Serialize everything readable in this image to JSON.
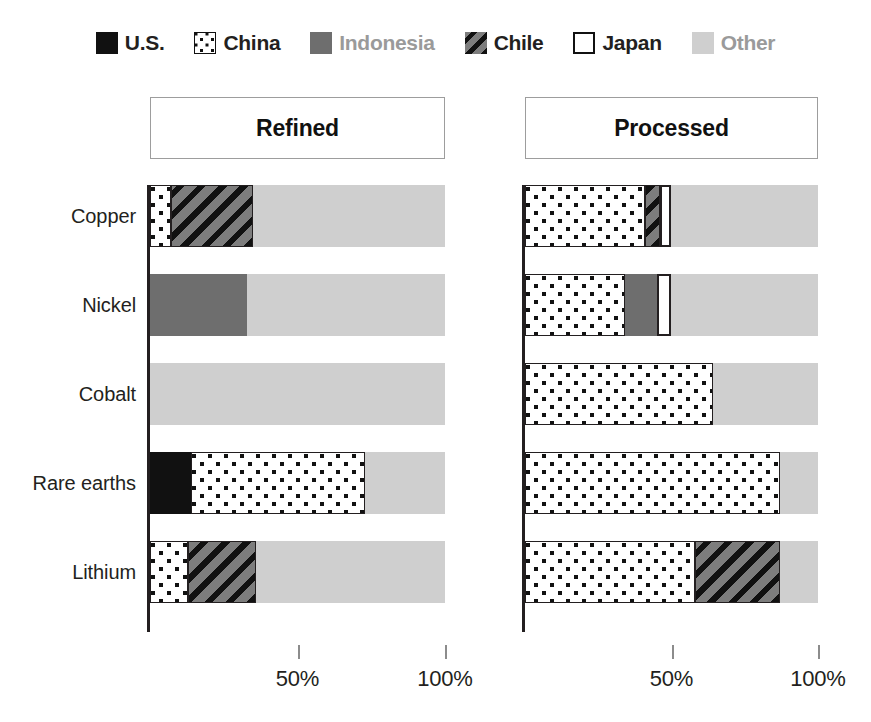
{
  "legend": {
    "items": [
      {
        "label": "U.S.",
        "key": "us",
        "swatch": "solid-black-swatch-icon",
        "muted": false
      },
      {
        "label": "China",
        "key": "china",
        "swatch": "dotted-box-swatch-icon",
        "muted": false
      },
      {
        "label": "Indonesia",
        "key": "indonesia",
        "swatch": "solid-gray-swatch-icon",
        "muted": true
      },
      {
        "label": "Chile",
        "key": "chile",
        "swatch": "hatched-box-swatch-icon",
        "muted": false
      },
      {
        "label": "Japan",
        "key": "japan",
        "swatch": "outlined-white-swatch-icon",
        "muted": false
      },
      {
        "label": "Other",
        "key": "other",
        "swatch": "light-gray-swatch-icon",
        "muted": true
      }
    ]
  },
  "panels": {
    "refined": {
      "title": "Refined"
    },
    "processed": {
      "title": "Processed"
    }
  },
  "axis": {
    "ticks": [
      {
        "value": 50,
        "label": "50%"
      },
      {
        "value": 100,
        "label": "100%"
      }
    ],
    "min": 0,
    "max": 100
  },
  "colors": {
    "us": "#111111",
    "china": "#ffffff",
    "indonesia": "#6e6e6e",
    "chile": "#7d7d7d",
    "japan": "#ffffff",
    "other": "#cfcfcf",
    "axis": "#231f20",
    "muted_text": "#9a9a9a",
    "panel_border": "#9d9d9d"
  },
  "chart_data": {
    "type": "bar",
    "title": "",
    "subtitle": "",
    "xlabel": "",
    "ylabel": "",
    "orientation": "horizontal",
    "stacked": true,
    "xlim": [
      0,
      100
    ],
    "grid": false,
    "legend_position": "top",
    "categories": [
      "Copper",
      "Nickel",
      "Cobalt",
      "Rare earths",
      "Lithium"
    ],
    "legend_entries": [
      "U.S.",
      "China",
      "Indonesia",
      "Chile",
      "Japan",
      "Other"
    ],
    "tick_labels": [
      "50%",
      "100%"
    ],
    "panels": [
      {
        "name": "Refined",
        "series": [
          {
            "name": "U.S.",
            "values": [
              0,
              0,
              0,
              14,
              0
            ]
          },
          {
            "name": "China",
            "values": [
              7,
              0,
              0,
              59,
              13
            ]
          },
          {
            "name": "Indonesia",
            "values": [
              0,
              33,
              0,
              0,
              0
            ]
          },
          {
            "name": "Chile",
            "values": [
              28,
              0,
              0,
              0,
              23
            ]
          },
          {
            "name": "Japan",
            "values": [
              0,
              0,
              0,
              0,
              0
            ]
          },
          {
            "name": "Other",
            "values": [
              65,
              67,
              100,
              27,
              64
            ]
          }
        ]
      },
      {
        "name": "Processed",
        "series": [
          {
            "name": "U.S.",
            "values": [
              0,
              0,
              0,
              0,
              0
            ]
          },
          {
            "name": "China",
            "values": [
              41,
              34,
              64,
              87,
              58
            ]
          },
          {
            "name": "Indonesia",
            "values": [
              0,
              11,
              0,
              0,
              0
            ]
          },
          {
            "name": "Chile",
            "values": [
              5,
              0,
              0,
              0,
              29
            ]
          },
          {
            "name": "Japan",
            "values": [
              4,
              5,
              0,
              0,
              0
            ]
          },
          {
            "name": "Other",
            "values": [
              50,
              50,
              36,
              13,
              13
            ]
          }
        ]
      }
    ]
  }
}
